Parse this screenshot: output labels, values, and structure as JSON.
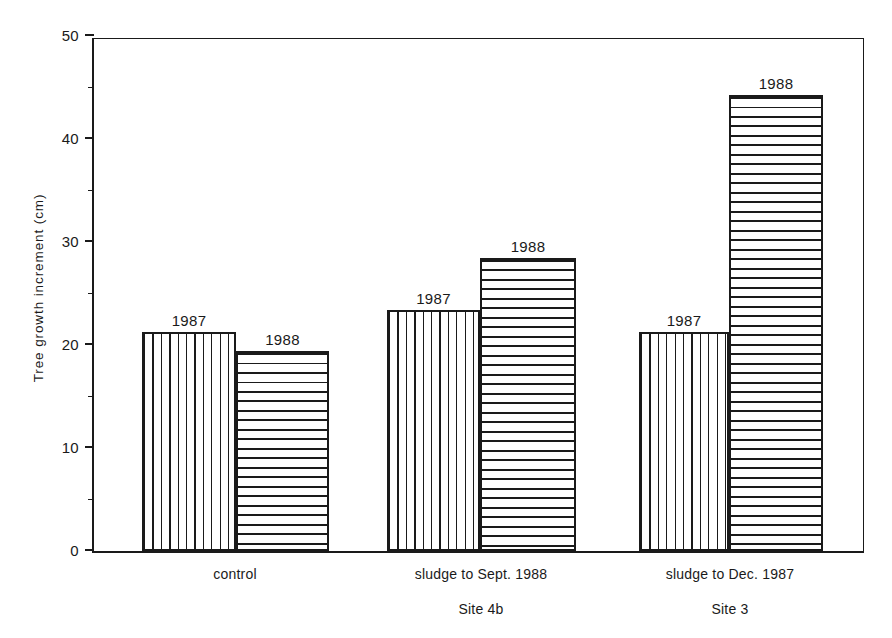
{
  "chart_data": {
    "type": "bar",
    "title": "",
    "xlabel": "",
    "ylabel": "Tree growth increment (cm)",
    "ylim": [
      0,
      50
    ],
    "yticks": [
      0,
      10,
      20,
      30,
      40,
      50
    ],
    "ytick_labels": [
      "0",
      "10",
      "20",
      "30",
      "40",
      "50"
    ],
    "grid": false,
    "legend": "none",
    "categories": [
      "control",
      "sludge to Sept. 1988",
      "sludge to Dec. 1987"
    ],
    "category_sublabels": [
      "",
      "Site 4b",
      "Site 3"
    ],
    "series": [
      {
        "name": "1987",
        "hatch": "vertical",
        "values": [
          21.3,
          23.4,
          21.3
        ]
      },
      {
        "name": "1988",
        "hatch": "horizontal",
        "values": [
          19.4,
          28.4,
          44.3
        ]
      }
    ],
    "bar_value_labels": [
      [
        "1987",
        "1988"
      ],
      [
        "1987",
        "1988"
      ],
      [
        "1987",
        "1988"
      ]
    ],
    "colors": {
      "ink": "#1a1a1a",
      "background": "#ffffff"
    }
  },
  "axis": {
    "y_title": "Tree growth increment (cm)",
    "ticks": [
      {
        "value": 50,
        "label": "50"
      },
      {
        "value": 45,
        "label": ""
      },
      {
        "value": 40,
        "label": "40"
      },
      {
        "value": 35,
        "label": ""
      },
      {
        "value": 30,
        "label": "30"
      },
      {
        "value": 25,
        "label": ""
      },
      {
        "value": 20,
        "label": "20"
      },
      {
        "value": 15,
        "label": ""
      },
      {
        "value": 10,
        "label": "10"
      },
      {
        "value": 5,
        "label": ""
      },
      {
        "value": 0,
        "label": "0"
      }
    ]
  },
  "groups": [
    {
      "label": "control",
      "sublabel": "",
      "bars": [
        {
          "series": "1987",
          "label": "1987",
          "value": 21.3
        },
        {
          "series": "1988",
          "label": "1988",
          "value": 19.4
        }
      ]
    },
    {
      "label": "sludge to Sept. 1988",
      "sublabel": "Site 4b",
      "bars": [
        {
          "series": "1987",
          "label": "1987",
          "value": 23.4
        },
        {
          "series": "1988",
          "label": "1988",
          "value": 28.4
        }
      ]
    },
    {
      "label": "sludge to Dec. 1987",
      "sublabel": "Site 3",
      "bars": [
        {
          "series": "1987",
          "label": "1987",
          "value": 21.3
        },
        {
          "series": "1988",
          "label": "1988",
          "value": 44.3
        }
      ]
    }
  ]
}
